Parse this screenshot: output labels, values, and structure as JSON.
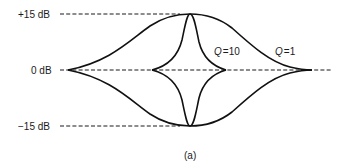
{
  "diagram": {
    "type": "equalizer-bell-response",
    "caption": "(a)",
    "levels": [
      {
        "label": "+15 dB",
        "value_db": 15
      },
      {
        "label": "0 dB",
        "value_db": 0
      },
      {
        "label": "−15 dB",
        "value_db": -15
      }
    ],
    "curves": [
      {
        "name": "Q=1",
        "q_symbol": "Q",
        "q_equals": "=",
        "q_value": "1",
        "shape": "wide boost and cut bell"
      },
      {
        "name": "Q=10",
        "q_symbol": "Q",
        "q_equals": "=",
        "q_value": "10",
        "shape": "narrow boost and cut bell"
      }
    ],
    "colors": {
      "line": "#111111",
      "text": "#1a1a1a",
      "background": "#ffffff"
    }
  }
}
